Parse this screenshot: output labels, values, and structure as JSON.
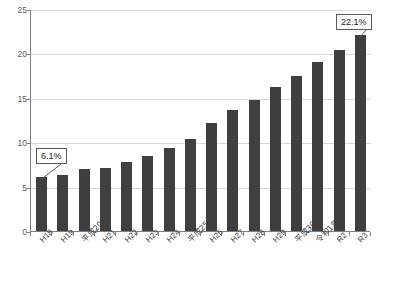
{
  "chart_data": {
    "type": "bar",
    "title": "",
    "subtitle": "",
    "xlabel": "",
    "ylabel": "",
    "ylim": [
      0,
      25
    ],
    "ytick_values": [
      0,
      5,
      10,
      15,
      20,
      25
    ],
    "ytick_labels": [
      "0",
      "5",
      "10",
      "15",
      "20",
      "25"
    ],
    "grid": true,
    "legend": "none",
    "bar_color": "#3f3f3f",
    "gridline_color": "#d9d9d9",
    "axis_color": "#7f7f7f",
    "categories": [
      "H18",
      "H19",
      "平成20年",
      "H21",
      "H22",
      "H23",
      "H24",
      "平成25年",
      "H26",
      "H27",
      "H28",
      "H29",
      "平成30年",
      "令和1年",
      "R2",
      "R3"
    ],
    "values": [
      6.1,
      6.3,
      7.0,
      7.1,
      7.8,
      8.5,
      9.3,
      10.4,
      12.2,
      13.6,
      14.8,
      16.2,
      17.5,
      19.0,
      20.4,
      22.1
    ],
    "annotations": [
      {
        "label": "6.1%",
        "target_category": "H18",
        "target_value": 6.1
      },
      {
        "label": "22.1%",
        "target_category": "R3",
        "target_value": 22.1
      }
    ]
  }
}
